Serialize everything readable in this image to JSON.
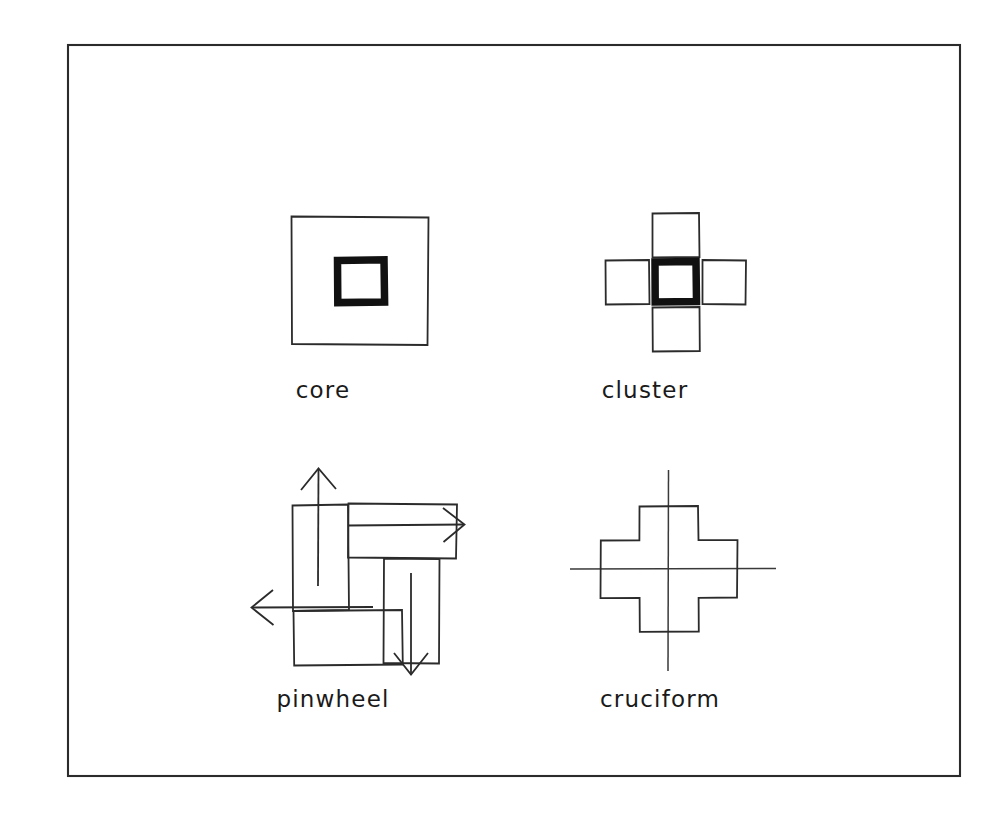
{
  "page": {
    "background_color": "#ffffff",
    "width": 1007,
    "height": 822
  },
  "frame": {
    "name": "outer-border",
    "x": 68,
    "y": 45,
    "width": 892,
    "height": 731,
    "stroke_color": "#2b2b2b"
  },
  "colors": {
    "ink": "#2b2b2b",
    "bold_ink": "#111111",
    "axis": "#3a3a3a",
    "label": "#1a1a1a",
    "paper": "#ffffff"
  },
  "figures": [
    {
      "id": "core",
      "label": "core",
      "label_x": 323,
      "label_y": 398,
      "description": "A large thin-outlined square with a small bold-outlined square near its center.",
      "center_x": 359,
      "center_y": 280,
      "outer_square": {
        "x": 291,
        "y": 216,
        "width": 137,
        "height": 129,
        "stroke": "thin"
      },
      "inner_square": {
        "x": 337,
        "y": 260,
        "width": 47,
        "height": 42,
        "stroke": "bold"
      }
    },
    {
      "id": "cluster",
      "label": "cluster",
      "label_x": 645,
      "label_y": 398,
      "description": "A bold-outlined central square surrounded by four thin-outlined squares on north, east, south and west.",
      "center_x": 675,
      "center_y": 282,
      "center_square": {
        "x": 651,
        "y": 258,
        "width": 48,
        "height": 47,
        "stroke": "bold"
      },
      "satellites": [
        {
          "position": "north",
          "x": 652,
          "y": 213,
          "width": 47,
          "height": 44,
          "stroke": "thin"
        },
        {
          "position": "east",
          "x": 702,
          "y": 260,
          "width": 44,
          "height": 44,
          "stroke": "thin"
        },
        {
          "position": "south",
          "x": 652,
          "y": 307,
          "width": 47,
          "height": 44,
          "stroke": "thin"
        },
        {
          "position": "west",
          "x": 605,
          "y": 260,
          "width": 44,
          "height": 44,
          "stroke": "thin"
        }
      ]
    },
    {
      "id": "pinwheel",
      "label": "pinwheel",
      "label_x": 333,
      "label_y": 707,
      "description": "Four elongated rectangles arranged in rotational (pinwheel) symmetry about a center, each with an arrow indicating outward direction of rotation.",
      "center_x": 366,
      "center_y": 566,
      "bars": [
        {
          "position": "left-vertical",
          "x": 292,
          "y": 505,
          "width": 56,
          "height": 105,
          "stroke": "thin"
        },
        {
          "position": "top-horizontal",
          "x": 348,
          "y": 503,
          "width": 109,
          "height": 55,
          "stroke": "thin"
        },
        {
          "position": "right-vertical",
          "x": 383,
          "y": 558,
          "width": 56,
          "height": 105,
          "stroke": "thin"
        },
        {
          "position": "bottom-horizontal",
          "x": 293,
          "y": 610,
          "width": 109,
          "height": 55,
          "stroke": "thin"
        }
      ],
      "arrows": [
        {
          "direction": "up",
          "x1": 318,
          "y1": 585,
          "x2": 318,
          "y2": 468
        },
        {
          "direction": "right",
          "x1": 348,
          "y1": 525,
          "x2": 463,
          "y2": 525
        },
        {
          "direction": "down",
          "x1": 411,
          "y1": 573,
          "x2": 411,
          "y2": 673
        },
        {
          "direction": "left",
          "x1": 372,
          "y1": 607,
          "x2": 252,
          "y2": 607
        }
      ]
    },
    {
      "id": "cruciform",
      "label": "cruciform",
      "label_x": 660,
      "label_y": 707,
      "description": "A plus-shaped (Greek cross) outline with horizontal and vertical centerlines extending past the form.",
      "center_x": 668,
      "center_y": 569,
      "arm_half_width": 29,
      "arm_half_length": 63,
      "centerlines": {
        "horizontal": {
          "x1": 570,
          "y1": 569,
          "x2": 775,
          "y2": 569
        },
        "vertical": {
          "x1": 668,
          "y1": 470,
          "x2": 668,
          "y2": 670
        }
      }
    }
  ]
}
